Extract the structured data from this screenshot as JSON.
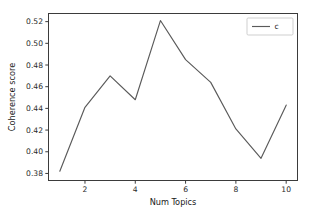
{
  "chart_data": {
    "type": "line",
    "title": "",
    "xlabel": "Num Topics",
    "ylabel": "Coherence score",
    "x": [
      1,
      2,
      3,
      4,
      5,
      6,
      7,
      8,
      9,
      10
    ],
    "series": [
      {
        "name": "c",
        "values": [
          0.382,
          0.441,
          0.47,
          0.448,
          0.521,
          0.485,
          0.464,
          0.421,
          0.394,
          0.443
        ],
        "color": "#5a5a5a"
      }
    ],
    "xlim": [
      0.55,
      10.45
    ],
    "ylim": [
      0.3735,
      0.5275
    ],
    "xticks": [
      2,
      4,
      6,
      8,
      10
    ],
    "xtick_labels": [
      "2",
      "4",
      "6",
      "8",
      "10"
    ],
    "yticks": [
      0.38,
      0.4,
      0.42,
      0.44,
      0.46,
      0.48,
      0.5,
      0.52
    ],
    "ytick_labels": [
      "0.38",
      "0.40",
      "0.42",
      "0.44",
      "0.46",
      "0.48",
      "0.50",
      "0.52"
    ],
    "grid": false,
    "legend": {
      "entries": [
        "c"
      ],
      "position": "upper right"
    },
    "axis_color": "#3b3b3b",
    "background_color": "#ffffff"
  }
}
